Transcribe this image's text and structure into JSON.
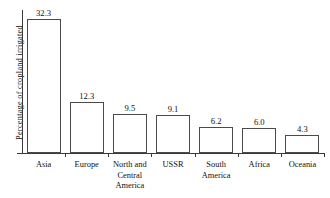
{
  "chart_data": {
    "type": "bar",
    "title": "",
    "xlabel": "",
    "ylabel": "Percentage of cropland irrigated",
    "categories": [
      "Asia",
      "Europe",
      "North and Central America",
      "USSR",
      "South America",
      "Africa",
      "Oceania"
    ],
    "category_lines": [
      [
        "Asia"
      ],
      [
        "Europe"
      ],
      [
        "North and",
        "Central",
        "America"
      ],
      [
        "USSR"
      ],
      [
        "South",
        "America"
      ],
      [
        "Africa"
      ],
      [
        "Oceania"
      ]
    ],
    "values": [
      32.3,
      12.3,
      9.5,
      9.1,
      6.2,
      6.0,
      4.3
    ],
    "value_labels": [
      "32.3",
      "12.3",
      "9.5",
      "9.1",
      "6.2",
      "6.0",
      "4.3"
    ],
    "ylim": [
      0,
      34.5
    ],
    "grid": false,
    "legend": null,
    "bar_fill_color": "#ffffff",
    "bar_border_color": "#4a4a4a",
    "axis_color": "#3a3a3a",
    "text_color": "#111111",
    "background_color": "#ffffff"
  }
}
